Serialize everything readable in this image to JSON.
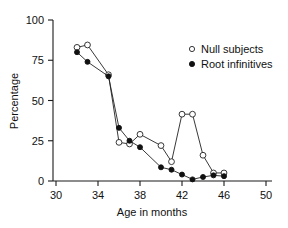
{
  "chart_data": {
    "type": "line",
    "title": "",
    "xlabel": "Age in months",
    "ylabel": "Percentage",
    "xlim": [
      30,
      50
    ],
    "ylim": [
      0,
      100
    ],
    "xticks": [
      30,
      34,
      38,
      42,
      46,
      50
    ],
    "yticks": [
      0,
      25,
      50,
      75,
      100
    ],
    "grid": false,
    "legend_position": "top-right",
    "x": [
      32,
      33,
      35,
      36,
      37,
      38,
      40,
      41,
      42,
      43,
      44,
      45,
      46
    ],
    "series": [
      {
        "name": "Null subjects",
        "marker": "open-circle",
        "x": [
          32,
          33,
          35,
          36,
          37,
          38,
          40,
          41,
          42,
          43,
          44,
          45,
          46
        ],
        "values": [
          83,
          84.5,
          66,
          24,
          23,
          29,
          22,
          12,
          41.5,
          41.5,
          16,
          5,
          5
        ]
      },
      {
        "name": "Root infinitives",
        "marker": "filled-circle",
        "x": [
          32,
          33,
          35,
          36,
          37,
          38,
          40,
          41,
          42,
          43,
          44,
          45,
          46
        ],
        "values": [
          80,
          74,
          65,
          33,
          25,
          21,
          8.5,
          7,
          4,
          1,
          2.5,
          3.5,
          3
        ]
      }
    ]
  },
  "axes": {
    "y_title": "Percentage",
    "x_title": "Age in months",
    "y_tick_labels": [
      "0",
      "25",
      "50",
      "75",
      "100"
    ],
    "x_tick_labels": [
      "30",
      "34",
      "38",
      "42",
      "46",
      "50"
    ]
  },
  "legend": {
    "entries": [
      {
        "label": "Null subjects",
        "marker": "open-circle"
      },
      {
        "label": "Root infinitives",
        "marker": "filled-circle"
      }
    ]
  },
  "colors": {
    "line": "#222222",
    "axis": "#1a1a1a",
    "text": "#111111",
    "background": "#ffffff",
    "marker_fill_open": "#ffffff",
    "marker_fill_closed": "#111111"
  }
}
